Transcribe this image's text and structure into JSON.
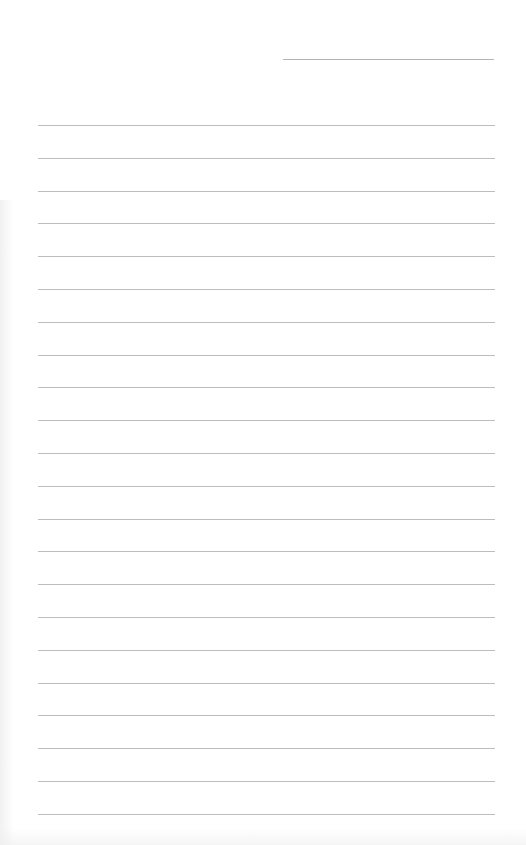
{
  "document": {
    "type": "lined-paper",
    "header_line": {
      "present": true,
      "text": ""
    },
    "ruled_lines": {
      "count": 22,
      "first_y": 125,
      "spacing": 32.8,
      "left": 38,
      "width": 457,
      "color": "#bdbdbd"
    },
    "lines": [
      "",
      "",
      "",
      "",
      "",
      "",
      "",
      "",
      "",
      "",
      "",
      "",
      "",
      "",
      "",
      "",
      "",
      "",
      "",
      "",
      "",
      ""
    ]
  }
}
